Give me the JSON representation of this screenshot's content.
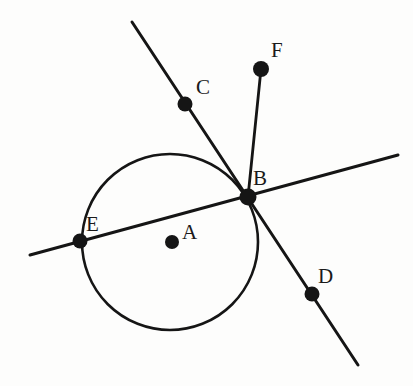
{
  "figure": {
    "kind": "geometry-diagram",
    "width": 413,
    "height": 386,
    "background_color": "#fdfdfc",
    "stroke_color": "#151515",
    "label_color": "#1a1a1a"
  },
  "circle": {
    "name": "circle-A",
    "center_label": "A",
    "cx": 170,
    "cy": 242,
    "r": 88,
    "stroke_width": 2.6
  },
  "points": [
    {
      "id": "A",
      "label": "A",
      "x": 172,
      "y": 242,
      "r": 7.0,
      "label_x": 182,
      "label_y": 222,
      "role": "center"
    },
    {
      "id": "B",
      "label": "B",
      "x": 248,
      "y": 197,
      "r": 8.5,
      "label_x": 253,
      "label_y": 168,
      "role": "on-circle"
    },
    {
      "id": "C",
      "label": "C",
      "x": 185,
      "y": 104,
      "r": 7.5,
      "label_x": 196,
      "label_y": 77,
      "role": "on-line"
    },
    {
      "id": "D",
      "label": "D",
      "x": 312,
      "y": 294,
      "r": 7.5,
      "label_x": 318,
      "label_y": 266,
      "role": "on-line"
    },
    {
      "id": "E",
      "label": "E",
      "x": 80,
      "y": 241,
      "r": 7.5,
      "label_x": 86,
      "label_y": 214,
      "role": "on-circle"
    },
    {
      "id": "F",
      "label": "F",
      "x": 261,
      "y": 69,
      "r": 8.0,
      "label_x": 271,
      "label_y": 40,
      "role": "endpoint"
    }
  ],
  "lines": [
    {
      "id": "secant-EB",
      "name": "secant-line-through-E-and-B",
      "x1": 30,
      "y1": 255,
      "x2": 398,
      "y2": 155,
      "stroke_width": 3.0
    },
    {
      "id": "line-CBD",
      "name": "line-through-C-B-D",
      "x1": 132,
      "y1": 22,
      "x2": 358,
      "y2": 365,
      "stroke_width": 3.0
    },
    {
      "id": "segment-BF",
      "name": "segment-B-to-F",
      "x1": 248,
      "y1": 197,
      "x2": 261,
      "y2": 69,
      "stroke_width": 2.8
    }
  ]
}
